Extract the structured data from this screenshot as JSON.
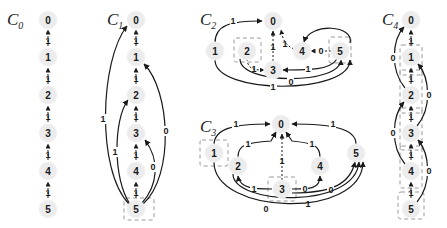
{
  "figure": {
    "graphs": [
      {
        "id": "C0",
        "title": "C",
        "subscript": "0",
        "nodes": [
          "0",
          "1",
          "2",
          "3",
          "4",
          "5"
        ],
        "edges": [
          {
            "from": "1",
            "to": "0",
            "label": "1"
          },
          {
            "from": "2",
            "to": "1",
            "label": "1"
          },
          {
            "from": "3",
            "to": "2",
            "label": "1"
          },
          {
            "from": "4",
            "to": "3",
            "label": "1"
          },
          {
            "from": "5",
            "to": "4",
            "label": "1"
          }
        ],
        "highlighted": []
      },
      {
        "id": "C1",
        "title": "C",
        "subscript": "1",
        "nodes": [
          "0",
          "1",
          "2",
          "3",
          "4",
          "5"
        ],
        "edges": [
          {
            "from": "1",
            "to": "0",
            "label": "1"
          },
          {
            "from": "2",
            "to": "1",
            "label": "1"
          },
          {
            "from": "3",
            "to": "2",
            "label": "1"
          },
          {
            "from": "4",
            "to": "3",
            "label": "1"
          },
          {
            "from": "5",
            "to": "4",
            "label": "1"
          },
          {
            "from": "5",
            "to": "0",
            "label": "1"
          },
          {
            "from": "5",
            "to": "2",
            "label": "1"
          },
          {
            "from": "5",
            "to": "1",
            "label": "0"
          },
          {
            "from": "5",
            "to": "3",
            "label": "0"
          }
        ],
        "highlighted": [
          "5"
        ]
      },
      {
        "id": "C2",
        "title": "C",
        "subscript": "2",
        "nodes": [
          "0",
          "1",
          "2",
          "3",
          "4",
          "5"
        ],
        "edges": [
          {
            "from": "1",
            "to": "0",
            "label": "1"
          },
          {
            "from": "3",
            "to": "0",
            "label": "1"
          },
          {
            "from": "4",
            "to": "0",
            "label": "1"
          },
          {
            "from": "5",
            "to": "4",
            "label": "0"
          },
          {
            "from": "2",
            "to": "3",
            "label": "1"
          },
          {
            "from": "5",
            "to": "3",
            "label": "1"
          },
          {
            "from": "2",
            "to": "5",
            "label": "0"
          },
          {
            "from": "1",
            "to": "5",
            "label": "1"
          },
          {
            "from": "5",
            "to": "4",
            "label": ""
          }
        ],
        "highlighted": [
          "2",
          "5"
        ]
      },
      {
        "id": "C3",
        "title": "C",
        "subscript": "3",
        "nodes": [
          "0",
          "1",
          "2",
          "3",
          "4",
          "5"
        ],
        "edges": [
          {
            "from": "1",
            "to": "0",
            "label": "1"
          },
          {
            "from": "2",
            "to": "0",
            "label": "1"
          },
          {
            "from": "3",
            "to": "0",
            "label": "1"
          },
          {
            "from": "4",
            "to": "0",
            "label": "1"
          },
          {
            "from": "5",
            "to": "0",
            "label": "1"
          },
          {
            "from": "3",
            "to": "2",
            "label": "1"
          },
          {
            "from": "3",
            "to": "4",
            "label": "0"
          },
          {
            "from": "3",
            "to": "5",
            "label": "0"
          },
          {
            "from": "2",
            "to": "5",
            "label": "1"
          },
          {
            "from": "1",
            "to": "5",
            "label": "0"
          }
        ],
        "highlighted": [
          "1",
          "3"
        ]
      },
      {
        "id": "C4",
        "title": "C",
        "subscript": "4",
        "nodes": [
          "0",
          "1",
          "2",
          "3",
          "4",
          "5"
        ],
        "edges": [
          {
            "from": "1",
            "to": "0",
            "label": "1"
          },
          {
            "from": "2",
            "to": "1",
            "label": "1"
          },
          {
            "from": "3",
            "to": "2",
            "label": "1"
          },
          {
            "from": "4",
            "to": "3",
            "label": "1"
          },
          {
            "from": "5",
            "to": "4",
            "label": "1"
          },
          {
            "from": "2",
            "to": "0",
            "label": "0"
          },
          {
            "from": "3",
            "to": "1",
            "label": "0"
          },
          {
            "from": "4",
            "to": "2",
            "label": "0"
          },
          {
            "from": "5",
            "to": "3",
            "label": "0"
          }
        ],
        "highlighted": [
          "1",
          "2",
          "3",
          "4",
          "5"
        ]
      }
    ],
    "labels": {
      "c0": {
        "t": "C",
        "s": "0"
      },
      "c1": {
        "t": "C",
        "s": "1"
      },
      "c2": {
        "t": "C",
        "s": "2"
      },
      "c3": {
        "t": "C",
        "s": "3"
      },
      "c4": {
        "t": "C",
        "s": "4"
      },
      "n0": "0",
      "n1": "1",
      "n2": "2",
      "n3": "3",
      "n4": "4",
      "n5": "5",
      "w0": "0",
      "w1": "1"
    }
  }
}
